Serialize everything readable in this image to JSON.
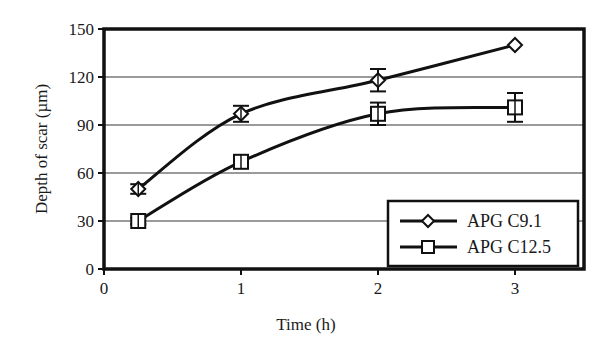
{
  "chart_data": {
    "type": "line",
    "title": "",
    "xlabel": "Time (h)",
    "ylabel": "Depth of scar (µm)",
    "xlim": [
      0,
      3.5
    ],
    "ylim": [
      0,
      150
    ],
    "x_ticks": [
      0,
      1,
      2,
      3
    ],
    "y_ticks": [
      0,
      30,
      60,
      90,
      120,
      150
    ],
    "grid": "horizontal",
    "legend_position": "lower right",
    "series": [
      {
        "name": "APG C9.1",
        "marker": "diamond",
        "x": [
          0.25,
          1,
          2,
          3
        ],
        "values": [
          50,
          97,
          118,
          140
        ],
        "error": [
          3,
          5,
          7,
          0
        ]
      },
      {
        "name": "APG C12.5",
        "marker": "square",
        "x": [
          0.25,
          1,
          2,
          3
        ],
        "values": [
          30,
          67,
          97,
          101
        ],
        "error": [
          2,
          2,
          7,
          9
        ]
      }
    ]
  },
  "colors": {
    "line": "#111111",
    "grid": "#9a9a9a",
    "frame": "#111111"
  }
}
